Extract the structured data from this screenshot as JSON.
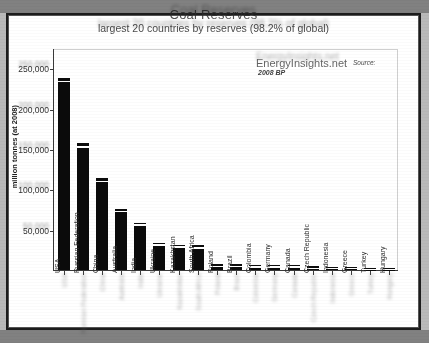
{
  "figure": {
    "title": "Coal Reserves",
    "subtitle": "largest 20 countries by reserves (98.2% of global)",
    "watermark": "EnergyInsights.net",
    "source_label": "Source:",
    "source_value": "2008 BP"
  },
  "chart_data": {
    "type": "bar",
    "title": "Coal Reserves",
    "subtitle": "largest 20 countries by reserves (98.2% of global)",
    "xlabel": "",
    "ylabel": "million tonnes (at 2008)",
    "ylim": [
      0,
      275000
    ],
    "grid": false,
    "legend": "none",
    "yticks": [
      50000,
      100000,
      150000,
      200000,
      250000
    ],
    "ytick_labels": [
      "50,000",
      "100,000",
      "150,000",
      "200,000",
      "250,000"
    ],
    "categories": [
      "USA",
      "Russian Federation",
      "China",
      "Australia",
      "India",
      "Ukraine",
      "Kazakhstan",
      "South Africa",
      "Poland",
      "Brazil",
      "Colombia",
      "Germany",
      "Canada",
      "Czech Republic",
      "Indonesia",
      "Greece",
      "Turkey",
      "Hungary"
    ],
    "values": [
      238308,
      157010,
      114500,
      76200,
      58600,
      33873,
      31300,
      30408,
      7502,
      7059,
      6814,
      6708,
      6578,
      4501,
      4328,
      3900,
      1814,
      1660
    ],
    "bar_color": "#0b0b0b",
    "annotations": [
      "EnergyInsights.net",
      "Source: 2008 BP"
    ]
  }
}
